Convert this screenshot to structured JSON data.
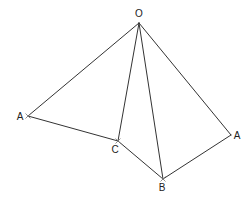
{
  "diagram": {
    "type": "geometric-figure",
    "stroke_color": "#333333",
    "label_color": "#222222",
    "points": [
      {
        "id": "O",
        "label": "O",
        "x": 139,
        "y": 23,
        "lx": 139,
        "ly": 17,
        "anchor": "middle",
        "mark": false
      },
      {
        "id": "A1",
        "label": "A",
        "x": 28,
        "y": 116,
        "lx": 20,
        "ly": 120,
        "anchor": "middle",
        "mark": true
      },
      {
        "id": "C",
        "label": "C",
        "x": 118,
        "y": 141,
        "lx": 115,
        "ly": 153,
        "anchor": "middle",
        "mark": true
      },
      {
        "id": "B",
        "label": "B",
        "x": 163,
        "y": 179,
        "lx": 162,
        "ly": 191,
        "anchor": "middle",
        "mark": true
      },
      {
        "id": "A2",
        "label": "A",
        "x": 231,
        "y": 135,
        "lx": 237,
        "ly": 139,
        "anchor": "middle",
        "mark": false
      }
    ],
    "segments": [
      [
        "O",
        "A1"
      ],
      [
        "O",
        "C"
      ],
      [
        "O",
        "B"
      ],
      [
        "O",
        "A2"
      ],
      [
        "A1",
        "C"
      ],
      [
        "C",
        "B"
      ],
      [
        "B",
        "A2"
      ]
    ]
  }
}
